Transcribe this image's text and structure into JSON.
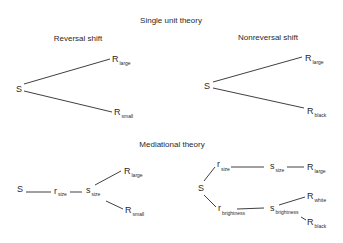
{
  "diagram": {
    "title": "Single unit theory",
    "panels": {
      "reversal": {
        "title": "Reversal shift",
        "stimulus": "S",
        "responses": [
          {
            "label": "R",
            "sub": "large"
          },
          {
            "label": "R",
            "sub": "small"
          }
        ]
      },
      "nonreversal": {
        "title": "Nonreversal shift",
        "stimulus": "S",
        "responses": [
          {
            "label": "R",
            "sub": "large"
          },
          {
            "label": "R",
            "sub": "black"
          }
        ]
      }
    },
    "mediational": {
      "title": "Mediational theory",
      "left": {
        "stimulus": "S",
        "r": {
          "label": "r",
          "sub": "size"
        },
        "s": {
          "label": "s",
          "sub": "size"
        },
        "responses": [
          {
            "label": "R",
            "sub": "large"
          },
          {
            "label": "R",
            "sub": "small"
          }
        ]
      },
      "right": {
        "stimulus": "S",
        "r_size": {
          "label": "r",
          "sub": "size"
        },
        "s_size": {
          "label": "s",
          "sub": "size"
        },
        "R_large": {
          "label": "R",
          "sub": "large"
        },
        "r_brightness": {
          "label": "r",
          "sub": "brightness"
        },
        "s_brightness": {
          "label": "s",
          "sub": "brightness"
        },
        "R_white": {
          "label": "R",
          "sub": "white"
        },
        "R_black": {
          "label": "R",
          "sub": "black"
        }
      }
    }
  }
}
